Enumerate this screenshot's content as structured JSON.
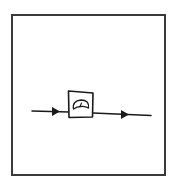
{
  "diagram": {
    "stroke_color": "#1a1a1a",
    "frame_color": "#3a3a3a",
    "elements": [
      {
        "type": "line",
        "name": "input-line"
      },
      {
        "type": "arrow",
        "name": "input-arrow",
        "direction": "right"
      },
      {
        "type": "block",
        "name": "meter-block",
        "icon": "gauge-icon"
      },
      {
        "type": "line",
        "name": "output-line"
      },
      {
        "type": "arrow",
        "name": "output-arrow",
        "direction": "right"
      }
    ]
  }
}
